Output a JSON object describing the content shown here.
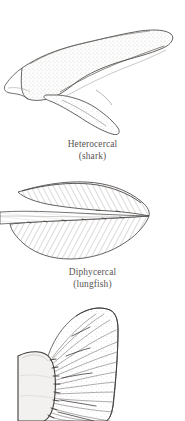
{
  "figure": {
    "background_color": "#ffffff",
    "ink_color": "#4a4745",
    "caption_color": "#595553",
    "panels": [
      {
        "id": "heterocercal",
        "illustration_name": "heterocercal-tail-illustration",
        "subject": "shark caudal fin with elongated upper lobe",
        "term": "Heterocercal",
        "common": "(shark)"
      },
      {
        "id": "diphycercal",
        "illustration_name": "diphycercal-tail-illustration",
        "subject": "lungfish symmetrical pointed caudal fin",
        "term": "Diphycercal",
        "common": "(lungfish)"
      },
      {
        "id": "homocercal",
        "illustration_name": "homocercal-tail-illustration",
        "subject": "fan shaped caudal fin with rays, cropped at image edge",
        "term": "",
        "common": ""
      }
    ]
  }
}
